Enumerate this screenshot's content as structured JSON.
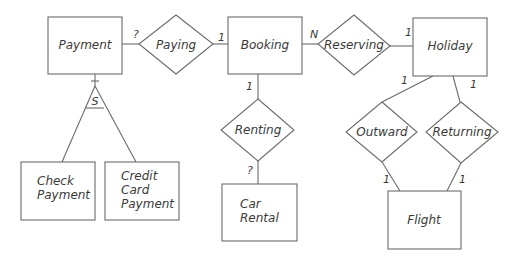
{
  "diagram": {
    "type": "entity-relationship",
    "entities": [
      {
        "id": "payment",
        "label": "Payment"
      },
      {
        "id": "booking",
        "label": "Booking"
      },
      {
        "id": "holiday",
        "label": "Holiday"
      },
      {
        "id": "check_payment",
        "label_lines": [
          "Check",
          "Payment"
        ]
      },
      {
        "id": "credit_card_payment",
        "label_lines": [
          "Credit",
          "Card",
          "Payment"
        ]
      },
      {
        "id": "car_rental",
        "label_lines": [
          "Car",
          "Rental"
        ]
      },
      {
        "id": "flight",
        "label": "Flight"
      }
    ],
    "relationships": [
      {
        "id": "paying",
        "label": "Paying"
      },
      {
        "id": "reserving",
        "label": "Reserving"
      },
      {
        "id": "renting",
        "label": "Renting"
      },
      {
        "id": "outward",
        "label": "Outward"
      },
      {
        "id": "returning",
        "label": "Returning"
      }
    ],
    "specialization": {
      "label": "S"
    },
    "cardinalities": {
      "payment_paying": "?",
      "paying_booking": "1",
      "booking_reserving": "N",
      "reserving_holiday": "1",
      "booking_renting": "1",
      "renting_car_rental": "?",
      "holiday_outward": "1",
      "holiday_returning": "1",
      "outward_flight": "1",
      "returning_flight": "1"
    }
  }
}
